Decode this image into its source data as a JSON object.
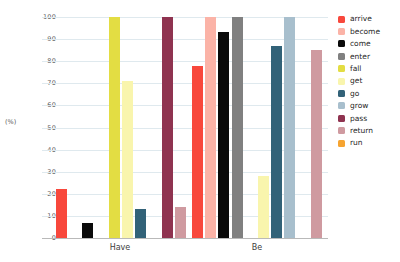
{
  "chart_data": {
    "type": "bar",
    "title": "",
    "xlabel": "",
    "ylabel": "(%)",
    "ylim": [
      0,
      100
    ],
    "ytick_labels": [
      "100",
      "90",
      "80",
      "70",
      "60",
      "50",
      "40",
      "30",
      "20",
      "10",
      "0"
    ],
    "ytick_values": [
      100,
      90,
      80,
      70,
      60,
      50,
      40,
      30,
      20,
      10,
      0
    ],
    "grid": true,
    "legend_position": "right",
    "categories": [
      "Have",
      "Be"
    ],
    "series": [
      {
        "name": "arrive",
        "color": "#f8483c",
        "values": [
          22,
          78
        ]
      },
      {
        "name": "become",
        "color": "#fbb3a7",
        "values": [
          null,
          100
        ]
      },
      {
        "name": "come",
        "color": "#0a0a0a",
        "values": [
          7,
          93
        ]
      },
      {
        "name": "enter",
        "color": "#808080",
        "values": [
          null,
          100
        ]
      },
      {
        "name": "fall",
        "color": "#e3dd43",
        "values": [
          100,
          null
        ]
      },
      {
        "name": "get",
        "color": "#f9f5ad",
        "values": [
          71,
          28
        ]
      },
      {
        "name": "go",
        "color": "#326278",
        "values": [
          13,
          87
        ]
      },
      {
        "name": "grow",
        "color": "#a8bfcd",
        "values": [
          null,
          100
        ]
      },
      {
        "name": "pass",
        "color": "#8f3350",
        "values": [
          100,
          null
        ]
      },
      {
        "name": "return",
        "color": "#cf9aa0",
        "values": [
          14,
          85
        ]
      },
      {
        "name": "run",
        "color": "#f6a431",
        "values": [
          null,
          null
        ]
      }
    ]
  },
  "legend": {
    "items": [
      {
        "label": "arrive",
        "color": "#f8483c"
      },
      {
        "label": "become",
        "color": "#fbb3a7"
      },
      {
        "label": "come",
        "color": "#0a0a0a"
      },
      {
        "label": "enter",
        "color": "#808080"
      },
      {
        "label": "fall",
        "color": "#e3dd43"
      },
      {
        "label": "get",
        "color": "#f9f5ad"
      },
      {
        "label": "go",
        "color": "#326278"
      },
      {
        "label": "grow",
        "color": "#a8bfcd"
      },
      {
        "label": "pass",
        "color": "#8f3350"
      },
      {
        "label": "return",
        "color": "#cf9aa0"
      },
      {
        "label": "run",
        "color": "#f6a431"
      }
    ]
  },
  "axes": {
    "y_title": "(%)",
    "x_categories": [
      "Have",
      "Be"
    ]
  }
}
